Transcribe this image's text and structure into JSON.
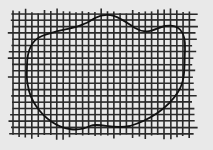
{
  "diagram": {
    "type": "grid-with-closed-curve",
    "colors": {
      "background": "#e9e9e9",
      "grid_line": "#2a2a2a",
      "curve": "#111111"
    },
    "grid": {
      "x_start": 13,
      "x_end": 192,
      "y_start": 14,
      "y_end": 134,
      "spacing": 6.3,
      "overhang": 4,
      "line_width": 1.6
    },
    "curve": {
      "closed": true,
      "stroke_width": 1.8,
      "path": "M 27 66 C 27 50, 32 40, 42 36 C 62 28, 78 30, 95 18 C 110 10, 120 18, 135 28 C 148 36, 155 28, 165 26 C 178 24, 186 30, 185 50 C 184 66, 186 80, 178 92 C 168 108, 150 120, 130 126 C 112 130, 100 122, 90 126 C 78 132, 64 130, 52 122 C 40 114, 30 100, 28 86 C 26 78, 27 72, 27 66 Z"
    }
  }
}
